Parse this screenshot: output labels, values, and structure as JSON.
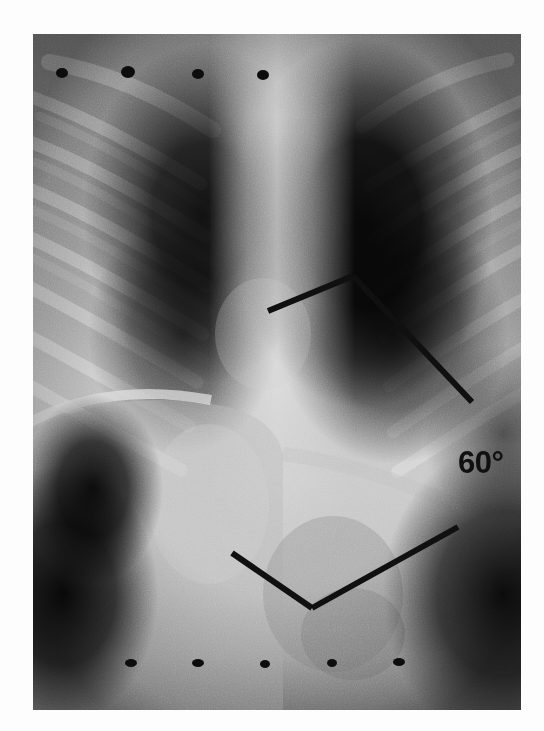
{
  "image": {
    "kind": "chest-radiograph",
    "description": "Posteroanterior chest radiograph showing thoracolumbar scoliosis with Cobb angle measurement overlay",
    "background_color": "#ffffff",
    "plate": {
      "x": 33,
      "y": 34,
      "width": 488,
      "height": 676
    }
  },
  "annotation": {
    "angle_label": "60°",
    "angle_value": 60,
    "angle_unit": "degrees",
    "label_x": 458,
    "label_y": 447,
    "line_color": "#101010",
    "line_width": 6,
    "measurement_name": "Cobb angle",
    "lines": [
      {
        "name": "upper-endplate-line",
        "x1": 268,
        "y1": 311,
        "x2": 353,
        "y2": 276
      },
      {
        "name": "upper-perpendicular-line",
        "x1": 353,
        "y1": 276,
        "x2": 472,
        "y2": 402
      },
      {
        "name": "lower-endplate-line",
        "x1": 232,
        "y1": 553,
        "x2": 312,
        "y2": 608
      },
      {
        "name": "lower-perpendicular-line",
        "x1": 312,
        "y1": 608,
        "x2": 458,
        "y2": 527
      }
    ],
    "intersection": {
      "x": 428,
      "y": 452
    }
  },
  "markers": {
    "description": "Radiopaque skin marker dots placed along the torso",
    "radius": 5,
    "color": "#0d0d0d",
    "top_row": [
      {
        "x": 62,
        "y": 73
      },
      {
        "x": 128,
        "y": 72
      },
      {
        "x": 198,
        "y": 74
      },
      {
        "x": 263,
        "y": 75
      }
    ],
    "bottom_row": [
      {
        "x": 131,
        "y": 663
      },
      {
        "x": 198,
        "y": 663
      },
      {
        "x": 265,
        "y": 664
      },
      {
        "x": 332,
        "y": 663
      },
      {
        "x": 399,
        "y": 662
      }
    ]
  },
  "anatomy": {
    "regions": [
      {
        "name": "left-lung-field",
        "tone": "radiolucent-dark"
      },
      {
        "name": "right-lung-field",
        "tone": "radiolucent-dark"
      },
      {
        "name": "spine-column",
        "tone": "radiopaque-bright"
      },
      {
        "name": "diaphragm",
        "tone": "mid-grey"
      },
      {
        "name": "abdomen",
        "tone": "bright-soft-tissue"
      },
      {
        "name": "gastric-gas-bubble",
        "tone": "dark"
      }
    ],
    "rib_bands_left": [
      118,
      163,
      208,
      252,
      296,
      340,
      384
    ],
    "rib_bands_right": [
      120,
      168,
      214,
      260,
      306,
      350,
      394
    ]
  }
}
